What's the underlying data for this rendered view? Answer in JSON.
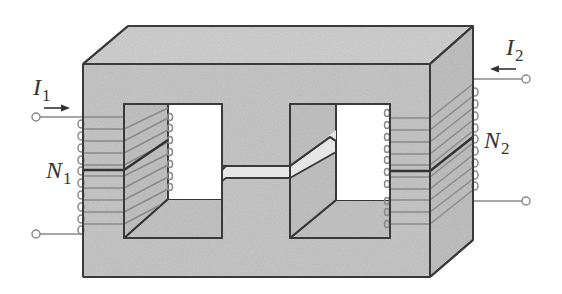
{
  "diagram": {
    "colors": {
      "core_fill": "#c9c9c9",
      "core_top": "#d2d2d2",
      "core_side": "#c3c3c3",
      "outline": "#3a3a3a",
      "wire": "#8a8a8a",
      "background": "#ffffff",
      "gap_fill": "#e6e6e6"
    },
    "labels": {
      "primary_current": {
        "symbol": "I",
        "sub": "1"
      },
      "secondary_current": {
        "symbol": "I",
        "sub": "2"
      },
      "primary_turns": {
        "symbol": "N",
        "sub": "1"
      },
      "secondary_turns": {
        "symbol": "N",
        "sub": "2"
      }
    },
    "components": [
      {
        "name": "magnetic-core",
        "description": "Rectangular laminated core with two windows"
      },
      {
        "name": "primary-winding",
        "leg": "left",
        "turns_drawn": 10
      },
      {
        "name": "secondary-winding",
        "leg": "right",
        "turns_drawn": 10
      },
      {
        "name": "air-gap",
        "leg": "center"
      },
      {
        "name": "primary-terminals",
        "count": 2
      },
      {
        "name": "secondary-terminals",
        "count": 2
      }
    ],
    "arrows": [
      {
        "name": "primary-current-arrow",
        "direction": "right"
      },
      {
        "name": "secondary-current-arrow",
        "direction": "left"
      }
    ]
  }
}
